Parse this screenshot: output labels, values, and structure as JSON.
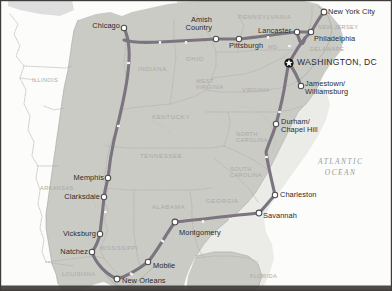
{
  "map": {
    "title": "Eastern United States Travel Route Map",
    "colors": {
      "land_shaded": "#c9c9c4",
      "land_unshaded": "#fbfbfa",
      "ocean": "#eeeeec",
      "lake": "#dcdcda",
      "route": "#7b7480",
      "route_tick": "#f2f0ee",
      "city_dot_fill": "#ffffff",
      "city_dot_stroke": "#4a4a4a",
      "capital_marker": "#1a1a1a",
      "state_border": "#b0aeaa",
      "frame": "#3c3a38",
      "state_label": "#a9a9a4",
      "city_label": "#2b2b2b",
      "ocean_label": "#9a9a96"
    },
    "ocean_label": {
      "line1": "ATLANTIC",
      "line2": "OCEAN"
    },
    "states": [
      {
        "name": "ILLINOIS",
        "x": 32,
        "y": 78,
        "align": "left",
        "size": "sm"
      },
      {
        "name": "INDIANA",
        "x": 138,
        "y": 66,
        "align": "left",
        "size": "norm"
      },
      {
        "name": "OHIO",
        "x": 186,
        "y": 56,
        "align": "left",
        "size": "norm"
      },
      {
        "name": "PENNSYLVANIA",
        "x": 238,
        "y": 14,
        "align": "left",
        "size": "norm"
      },
      {
        "name": "NEW JERSEY",
        "x": 318,
        "y": 25,
        "align": "left",
        "size": "sm"
      },
      {
        "name": "DELAWARE",
        "x": 310,
        "y": 47,
        "align": "left",
        "size": "sm"
      },
      {
        "name": "MD",
        "x": 268,
        "y": 45,
        "align": "left",
        "size": "sm"
      },
      {
        "name": "WEST VIRGINIA",
        "x": 196,
        "y": 78,
        "align": "left",
        "size": "sm",
        "lines": [
          "WEST",
          "VIRGINIA"
        ]
      },
      {
        "name": "VIRGINIA",
        "x": 242,
        "y": 88,
        "align": "left",
        "size": "sm"
      },
      {
        "name": "KENTUCKY",
        "x": 152,
        "y": 114,
        "align": "left",
        "size": "norm"
      },
      {
        "name": "TENNESSEE",
        "x": 140,
        "y": 153,
        "align": "left",
        "size": "norm"
      },
      {
        "name": "NORTH CAROLINA",
        "x": 236,
        "y": 131,
        "align": "left",
        "size": "sm",
        "lines": [
          "NORTH",
          "CAROLINA"
        ]
      },
      {
        "name": "SOUTH CAROLINA",
        "x": 230,
        "y": 166,
        "align": "left",
        "size": "sm",
        "lines": [
          "SOUTH",
          "CAROLINA"
        ]
      },
      {
        "name": "ARKANSAS",
        "x": 40,
        "y": 186,
        "align": "left",
        "size": "sm"
      },
      {
        "name": "MISSISSIPPI",
        "x": 100,
        "y": 246,
        "align": "left",
        "size": "sm"
      },
      {
        "name": "ALABAMA",
        "x": 152,
        "y": 204,
        "align": "left",
        "size": "norm"
      },
      {
        "name": "GEORGIA",
        "x": 206,
        "y": 198,
        "align": "left",
        "size": "norm"
      },
      {
        "name": "LOUISIANA",
        "x": 62,
        "y": 272,
        "align": "left",
        "size": "sm"
      },
      {
        "name": "FLORIDA",
        "x": 250,
        "y": 274,
        "align": "left",
        "size": "sm"
      }
    ],
    "cities": [
      {
        "name": "Chicago",
        "dx": 124,
        "dy": 27,
        "lx": 120,
        "ly": 22,
        "align": "right",
        "style": "plain"
      },
      {
        "name": "Amish Country",
        "dx": 216,
        "dy": 39,
        "lx": 212,
        "ly": 16,
        "align": "right",
        "style": "plain",
        "lines": [
          "Amish",
          "Country"
        ]
      },
      {
        "name": "Pittsburgh",
        "dx": 239,
        "dy": 39,
        "lx": 229,
        "ly": 42,
        "align": "left",
        "style": "plain"
      },
      {
        "name": "Lancaster",
        "dx": 297,
        "dy": 32,
        "lx": 258,
        "ly": 27,
        "align": "left",
        "style": "plain"
      },
      {
        "name": "Philadelphia",
        "dx": 311,
        "dy": 32,
        "lx": 314,
        "ly": 35,
        "align": "left",
        "style": "plain"
      },
      {
        "name": "New York City",
        "dx": 324,
        "dy": 12,
        "lx": 328,
        "ly": 8,
        "align": "left",
        "style": "plain"
      },
      {
        "name": "WASHINGTON, DC",
        "dx": 289,
        "dy": 63,
        "lx": 297,
        "ly": 58,
        "align": "left",
        "style": "capital"
      },
      {
        "name": "Jamestown/ Williamsburg",
        "dx": 301,
        "dy": 86,
        "lx": 305,
        "ly": 80,
        "align": "left",
        "style": "plain",
        "lines": [
          "Jamestown/",
          "Williamsburg"
        ]
      },
      {
        "name": "Durham/ Chapel Hill",
        "dx": 276,
        "dy": 124,
        "lx": 281,
        "ly": 118,
        "align": "left",
        "style": "plain",
        "lines": [
          "Durham/",
          "Chapel Hill"
        ]
      },
      {
        "name": "Charleston",
        "dx": 275,
        "dy": 195,
        "lx": 280,
        "ly": 191,
        "align": "left",
        "style": "plain"
      },
      {
        "name": "Savannah",
        "dx": 259,
        "dy": 213,
        "lx": 263,
        "ly": 212,
        "align": "left",
        "style": "plain"
      },
      {
        "name": "Montgomery",
        "dx": 175,
        "dy": 222,
        "lx": 179,
        "ly": 229,
        "align": "left",
        "style": "plain"
      },
      {
        "name": "Mobile",
        "dx": 148,
        "dy": 262,
        "lx": 153,
        "ly": 262,
        "align": "left",
        "style": "plain"
      },
      {
        "name": "New Orleans",
        "dx": 117,
        "dy": 279,
        "lx": 122,
        "ly": 277,
        "align": "left",
        "style": "plain"
      },
      {
        "name": "Natchez",
        "dx": 92,
        "dy": 252,
        "lx": 88,
        "ly": 248,
        "align": "right",
        "style": "plain"
      },
      {
        "name": "Vicksburg",
        "dx": 100,
        "dy": 234,
        "lx": 96,
        "ly": 230,
        "align": "right",
        "style": "plain"
      },
      {
        "name": "Clarksdale",
        "dx": 104,
        "dy": 197,
        "lx": 100,
        "ly": 193,
        "align": "right",
        "style": "plain"
      },
      {
        "name": "Memphis",
        "dx": 108,
        "dy": 178,
        "lx": 104,
        "ly": 174,
        "align": "right",
        "style": "plain"
      }
    ]
  }
}
